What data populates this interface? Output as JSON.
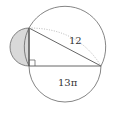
{
  "diagram": {
    "type": "geometry",
    "labels": {
      "hypotenuse": "12",
      "bottom_semicircle": "13π"
    },
    "colors": {
      "stroke": "#555555",
      "shaded_region": "#d9d9d9",
      "dotted_arc": "#999999",
      "background": "#ffffff"
    },
    "shapes": {
      "triangle": {
        "vertices": [
          [
            29,
            28
          ],
          [
            29,
            66
          ],
          [
            101,
            66
          ]
        ],
        "right_angle_at": [
          29,
          66
        ]
      },
      "circumcircle": {
        "center": [
          65,
          47
        ],
        "radius": 40.7
      },
      "bottom_semicircle": {
        "center": [
          65,
          66
        ],
        "radius": 36
      },
      "left_semicircle": {
        "center": [
          29,
          47
        ],
        "radius": 19,
        "shaded": true
      }
    }
  }
}
